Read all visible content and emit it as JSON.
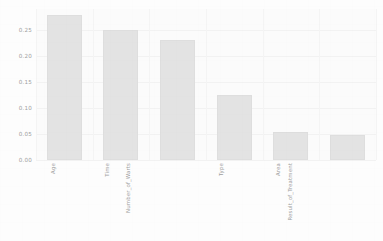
{
  "chart_data": {
    "type": "bar",
    "title": "",
    "subtitle": "",
    "xlabel": "",
    "ylabel": "",
    "categories": [
      "Age",
      "Time",
      "Number_of_Warts",
      "Type",
      "Area",
      "Result_of_Treatment"
    ],
    "values": [
      0.278,
      0.25,
      0.23,
      0.125,
      0.053,
      0.048
    ],
    "ylim": [
      0.0,
      0.29
    ],
    "yticks": [
      0.0,
      0.05,
      0.1,
      0.15,
      0.2,
      0.25
    ],
    "ytick_labels": [
      "0.00",
      "0.05",
      "0.10",
      "0.15",
      "0.20",
      "0.25"
    ],
    "grid": true,
    "legend": null,
    "legend_position": "none",
    "bar_color": "#e3e3e3",
    "bar_edge_color": "#dedede",
    "text_color": "#9d9d9d",
    "background_color": "#fdfdfd",
    "plot_background_color": "#fbfbfb",
    "gridline_color": "#f2f2f2",
    "xtick_rotation": 90,
    "series": [
      {
        "name": "importance",
        "values": [
          0.278,
          0.25,
          0.23,
          0.125,
          0.053,
          0.048
        ]
      }
    ]
  }
}
